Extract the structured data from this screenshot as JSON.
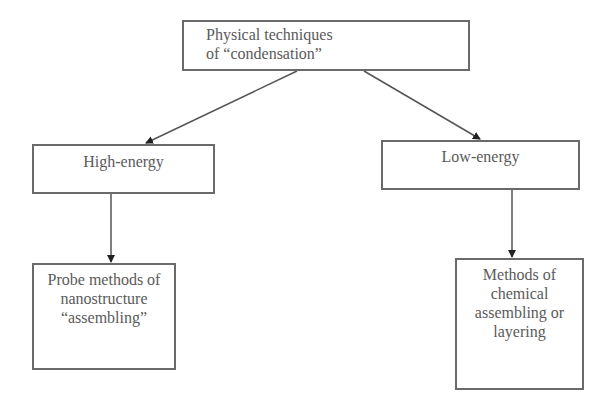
{
  "diagram": {
    "type": "tree",
    "nodes": {
      "root": {
        "label": "Physical techniques\nof “condensation”"
      },
      "high_energy": {
        "label": "High-energy"
      },
      "low_energy": {
        "label": "Low-energy"
      },
      "probe_methods": {
        "label": "Probe methods of\nnanostructure\n“assembling”"
      },
      "chemical_methods": {
        "label": "Methods of\nchemical\nassembling or\nlayering"
      }
    },
    "edges": [
      {
        "from": "root",
        "to": "high_energy"
      },
      {
        "from": "root",
        "to": "low_energy"
      },
      {
        "from": "high_energy",
        "to": "probe_methods"
      },
      {
        "from": "low_energy",
        "to": "chemical_methods"
      }
    ],
    "colors": {
      "border": "#6a6a6a",
      "text": "#5a5a5a",
      "arrow": "#555555",
      "background": "#ffffff"
    }
  }
}
